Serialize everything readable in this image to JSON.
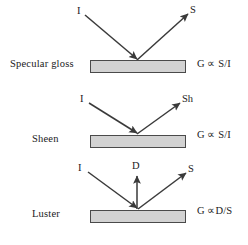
{
  "figure": {
    "background_color": "#ffffff",
    "slab_fill_color": "#d2d2d2",
    "slab_border_color": "#4a4a4a",
    "arrow_color": "#3a3a3a"
  },
  "panels": [
    {
      "id": "specular-gloss",
      "label": "Specular gloss",
      "formula": "G ∝ S/I",
      "rays": [
        {
          "name": "incident",
          "label": "I",
          "direction": "down-right"
        },
        {
          "name": "specular",
          "label": "S",
          "direction": "up-right"
        }
      ]
    },
    {
      "id": "sheen",
      "label": "Sheen",
      "formula": "G ∝ S/I",
      "rays": [
        {
          "name": "incident",
          "label": "I",
          "direction": "down-right"
        },
        {
          "name": "sheen",
          "label": "Sh",
          "direction": "up-right"
        }
      ]
    },
    {
      "id": "luster",
      "label": "Luster",
      "formula": "G ∝D/S",
      "rays": [
        {
          "name": "incident",
          "label": "I",
          "direction": "down-right"
        },
        {
          "name": "diffuse",
          "label": "D",
          "direction": "up"
        },
        {
          "name": "specular",
          "label": "S",
          "direction": "up-right"
        }
      ]
    }
  ]
}
